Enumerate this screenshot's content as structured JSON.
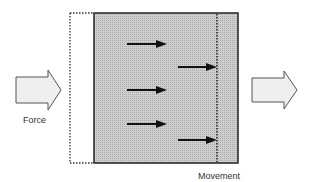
{
  "diagram": {
    "labels": {
      "force": "Force",
      "movement": "Movement"
    },
    "colors": {
      "block_fill": "#c8c8c8",
      "block_border": "#222222",
      "arrow": "#111111",
      "block_arrow_fill": "#efefef",
      "block_arrow_stroke": "#555555",
      "dotted": "#333333"
    },
    "elements": {
      "original_position_outline": "dotted rectangle (previous position)",
      "displaced_block": "shaded rectangle",
      "displacement_line": "dotted vertical line",
      "internal_arrows": 5
    }
  }
}
